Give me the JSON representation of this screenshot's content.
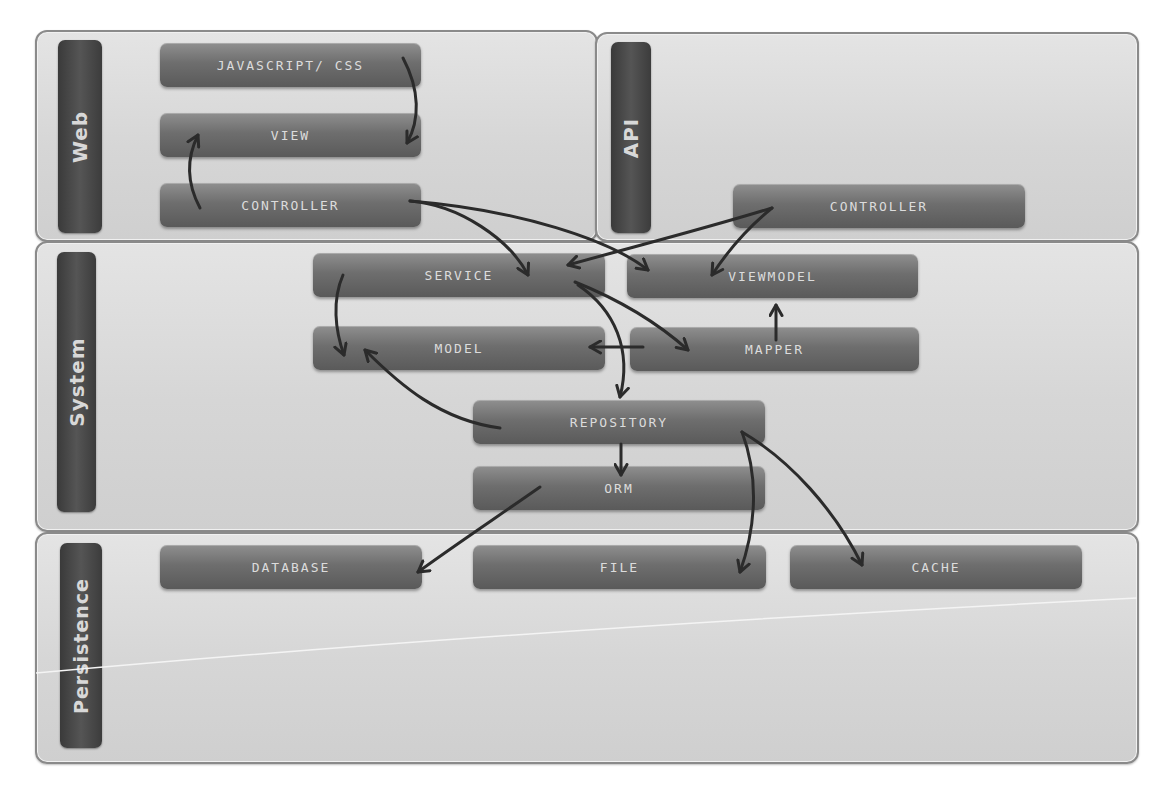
{
  "layers": {
    "web": {
      "label": "Web"
    },
    "api": {
      "label": "API"
    },
    "system": {
      "label": "System"
    },
    "persistence": {
      "label": "Persistence"
    }
  },
  "nodes": {
    "js_css": "JAVASCRIPT/ CSS",
    "view": "VIEW",
    "web_controller": "CONTROLLER",
    "api_controller": "CONTROLLER",
    "service": "SERVICE",
    "viewmodel": "VIEWMODEL",
    "model": "MODEL",
    "mapper": "MAPPER",
    "repository": "REPOSITORY",
    "orm": "ORM",
    "database": "DATABASE",
    "file": "FILE",
    "cache": "CACHE"
  },
  "edges": [
    {
      "from": "JAVASCRIPT/ CSS",
      "to": "VIEW"
    },
    {
      "from": "CONTROLLER (Web)",
      "to": "VIEW"
    },
    {
      "from": "CONTROLLER (Web)",
      "to": "SERVICE"
    },
    {
      "from": "CONTROLLER (Web)",
      "to": "VIEWMODEL"
    },
    {
      "from": "CONTROLLER (API)",
      "to": "SERVICE"
    },
    {
      "from": "CONTROLLER (API)",
      "to": "VIEWMODEL"
    },
    {
      "from": "SERVICE",
      "to": "MODEL"
    },
    {
      "from": "SERVICE",
      "to": "MAPPER"
    },
    {
      "from": "SERVICE",
      "to": "REPOSITORY"
    },
    {
      "from": "MAPPER",
      "to": "VIEWMODEL"
    },
    {
      "from": "MAPPER",
      "to": "MODEL"
    },
    {
      "from": "REPOSITORY",
      "to": "MODEL"
    },
    {
      "from": "REPOSITORY",
      "to": "ORM"
    },
    {
      "from": "REPOSITORY",
      "to": "FILE"
    },
    {
      "from": "REPOSITORY",
      "to": "CACHE"
    },
    {
      "from": "ORM",
      "to": "DATABASE"
    }
  ]
}
